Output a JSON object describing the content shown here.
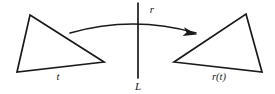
{
  "figure": {
    "background_color": "#ffffff",
    "ink_color": "#1a1a1a",
    "labels": {
      "source_shape": "t",
      "image_shape": "r(t)",
      "mapping": "r",
      "line": "L"
    },
    "shapes": {
      "source_triangle": {
        "name": "t",
        "points": "30,15 104,62 17,72"
      },
      "image_triangle": {
        "name": "r(t)",
        "points": "246,14 262,72 174,62"
      },
      "reflection_line": {
        "name": "L",
        "x1": 138,
        "y1": 3,
        "x2": 138,
        "y2": 78
      },
      "mapping_arrow": {
        "name": "r",
        "path": "M 70,33 Q 133,15 196,33"
      }
    },
    "label_positions": {
      "source_shape": {
        "x": 58,
        "y": 80
      },
      "image_shape": {
        "x": 206,
        "y": 80
      },
      "mapping": {
        "x": 149,
        "y": 13
      },
      "line": {
        "x": 134,
        "y": 90
      }
    }
  }
}
